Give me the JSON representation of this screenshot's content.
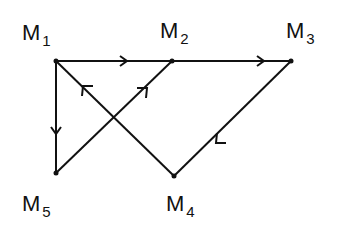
{
  "nodes": [
    {
      "id": "M1",
      "name": "M",
      "sub": "1",
      "x": 56,
      "y": 61
    },
    {
      "id": "M2",
      "name": "M",
      "sub": "2",
      "x": 172,
      "y": 61
    },
    {
      "id": "M3",
      "name": "M",
      "sub": "3",
      "x": 291,
      "y": 61
    },
    {
      "id": "M4",
      "name": "M",
      "sub": "4",
      "x": 174,
      "y": 176
    },
    {
      "id": "M5",
      "name": "M",
      "sub": "5",
      "x": 56,
      "y": 173
    }
  ],
  "edges": [
    {
      "from": "M1",
      "to": "M2"
    },
    {
      "from": "M2",
      "to": "M3"
    },
    {
      "from": "M3",
      "to": "M4"
    },
    {
      "from": "M4",
      "to": "M1"
    },
    {
      "from": "M5",
      "to": "M2"
    },
    {
      "from": "M1",
      "to": "M5"
    }
  ],
  "colors": {
    "line": "#111111",
    "background": "#ffffff"
  }
}
